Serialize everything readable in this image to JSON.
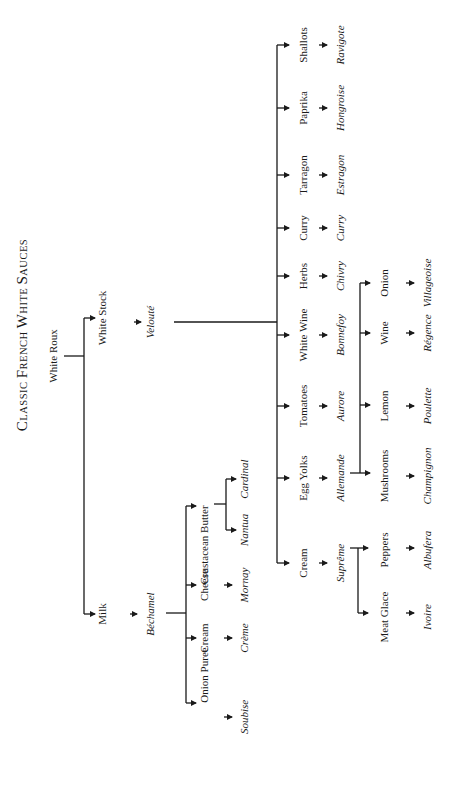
{
  "title": "Classic French White Sauces",
  "title_display": {
    "c1": "C",
    "r1": "LASSIC ",
    "c2": "F",
    "r2": "RENCH ",
    "c3": "W",
    "r3": "HITE ",
    "c4": "S",
    "r4": "AUCES"
  },
  "orientation": "rotated 90° counter-clockwise",
  "root": {
    "label": "White Roux"
  },
  "branches": {
    "white_stock": {
      "ingredient": "White Stock",
      "mother_sauce": "Velouté",
      "children": [
        {
          "ingredient": "Cream",
          "sauce": "Suprême"
        },
        {
          "ingredient": "Egg Yolks",
          "sauce": "Allemande"
        },
        {
          "ingredient": "Tomatoes",
          "sauce": "Aurore"
        },
        {
          "ingredient": "White Wine",
          "sauce": "Bonnefoy"
        },
        {
          "ingredient": "Herbs",
          "sauce": "Chivry"
        },
        {
          "ingredient": "Curry",
          "sauce": "Curry"
        },
        {
          "ingredient": "Tarragon",
          "sauce": "Estragon"
        },
        {
          "ingredient": "Paprika",
          "sauce": "Hongroise"
        },
        {
          "ingredient": "Shallots",
          "sauce": "Ravigote"
        }
      ],
      "supreme_children": [
        {
          "ingredient": "Meat Glace",
          "sauce": "Ivoire"
        },
        {
          "ingredient": "Peppers",
          "sauce": "Albufera"
        }
      ],
      "allemande_children": [
        {
          "ingredient": "Mushrooms",
          "sauce": "Champignon"
        },
        {
          "ingredient": "Lemon",
          "sauce": "Poulette"
        },
        {
          "ingredient": "Wine",
          "sauce": "Régence"
        },
        {
          "ingredient": "Onion",
          "sauce": "Villageoise"
        }
      ]
    },
    "milk": {
      "ingredient": "Milk",
      "mother_sauce": "Béchamel",
      "children": [
        {
          "ingredient": "Onion Puree",
          "sauce": "Soubise"
        },
        {
          "ingredient": "Cream",
          "sauce": "Crème"
        },
        {
          "ingredient": "Cheese",
          "sauce": "Mornay"
        },
        {
          "ingredient": "Crustacean Butter",
          "sauce": null
        }
      ],
      "crustacean_children": [
        {
          "sauce": "Nantua"
        },
        {
          "sauce": "Cardinal"
        }
      ]
    }
  }
}
